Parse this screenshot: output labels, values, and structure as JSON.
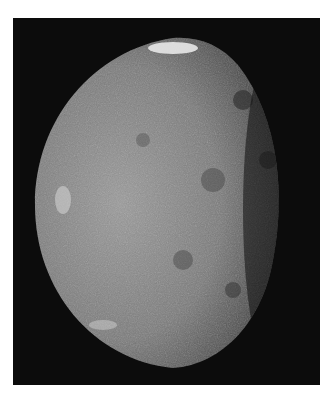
{
  "image": {
    "subject": "grayscale photograph of a cratered moon, lit from the left with the terminator on the right",
    "background": "#0c0c0c",
    "page_background": "#ffffff"
  }
}
